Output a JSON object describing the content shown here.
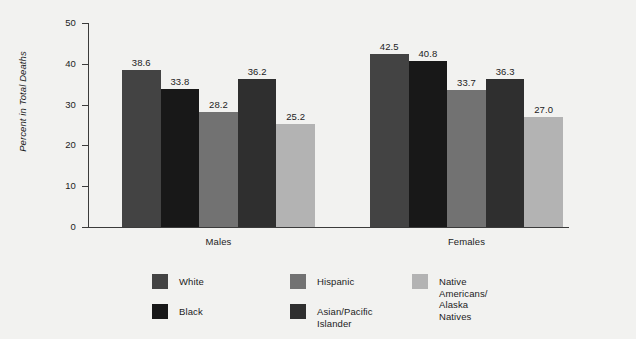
{
  "chart_data": {
    "type": "bar",
    "title": "",
    "subtitle": "",
    "xlabel": "",
    "ylabel": "Percent in Total Deaths",
    "ylim": [
      0,
      50
    ],
    "yticks": [
      0,
      10,
      20,
      30,
      40,
      50
    ],
    "ytick_labels": [
      "0",
      "10",
      "20",
      "30",
      "40",
      "50"
    ],
    "grid": false,
    "legend_position": "bottom",
    "categories": [
      "Males",
      "Females"
    ],
    "series": [
      {
        "name": "White",
        "color": "#434343",
        "values": [
          38.6,
          42.5
        ],
        "value_labels": [
          "38.6",
          "42.5"
        ]
      },
      {
        "name": "Black",
        "color": "#181818",
        "values": [
          33.8,
          40.8
        ],
        "value_labels": [
          "33.8",
          "40.8"
        ]
      },
      {
        "name": "Hispanic",
        "color": "#727272",
        "values": [
          28.2,
          33.7
        ],
        "value_labels": [
          "28.2",
          "33.7"
        ]
      },
      {
        "name": "Asian/Pacific Islander",
        "color": "#2f2f2f",
        "values": [
          36.2,
          36.3
        ],
        "value_labels": [
          "36.2",
          "36.3"
        ]
      },
      {
        "name": "Native Americans/\nAlaska Natives",
        "color": "#b3b3b3",
        "values": [
          25.2,
          27.0
        ],
        "value_labels": [
          "25.2",
          "27.0"
        ]
      }
    ]
  },
  "axis": {
    "y_title": "Percent in Total Deaths",
    "y_labels": [
      "50",
      "40",
      "30",
      "20",
      "10",
      "0"
    ],
    "x_labels": [
      "Males",
      "Females"
    ]
  },
  "legend": {
    "items": [
      {
        "label": "White",
        "color": "#434343"
      },
      {
        "label": "Black",
        "color": "#181818"
      },
      {
        "label": "Hispanic",
        "color": "#727272"
      },
      {
        "label": "Asian/Pacific Islander",
        "color": "#2f2f2f"
      },
      {
        "label": "Native Americans/\nAlaska Natives",
        "color": "#b3b3b3"
      }
    ]
  },
  "colors": {
    "background": "#f2f2f0",
    "axis": "#3b3b3b",
    "text": "#1c1c1c"
  }
}
